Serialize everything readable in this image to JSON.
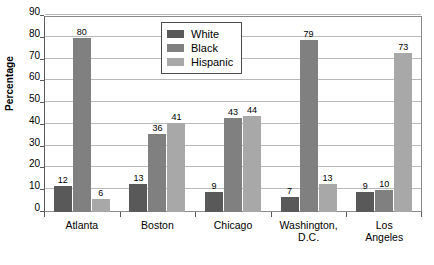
{
  "chart_data": {
    "type": "bar",
    "title": "",
    "subtitle": "",
    "xlabel": "",
    "ylabel": "Percentage",
    "ylim": [
      0,
      90
    ],
    "y_ticks": [
      0,
      10,
      20,
      30,
      40,
      50,
      60,
      70,
      80,
      90
    ],
    "grid": true,
    "legend_position": "top-center",
    "categories": [
      "Atlanta",
      "Boston",
      "Chicago",
      "Washington,\nD.C.",
      "Los Angeles"
    ],
    "series": [
      {
        "name": "White",
        "color": "#595959",
        "values": [
          12,
          13,
          9,
          7,
          9
        ]
      },
      {
        "name": "Black",
        "color": "#808080",
        "values": [
          80,
          36,
          43,
          79,
          10
        ]
      },
      {
        "name": "Hispanic",
        "color": "#a8a8a8",
        "values": [
          6,
          41,
          44,
          13,
          73
        ]
      }
    ]
  },
  "legend": {
    "items": [
      {
        "label": "White",
        "color": "#595959"
      },
      {
        "label": "Black",
        "color": "#808080"
      },
      {
        "label": "Hispanic",
        "color": "#a8a8a8"
      }
    ]
  },
  "axis": {
    "y_title": "Percentage"
  }
}
